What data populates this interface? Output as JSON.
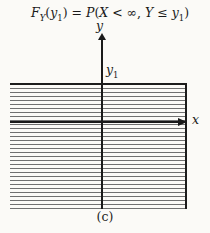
{
  "figure": {
    "title": {
      "parts": [
        {
          "text": "F"
        },
        {
          "text": "Y"
        },
        {
          "text": "("
        },
        {
          "text": "y"
        },
        {
          "text": "1"
        },
        {
          "text": ") = "
        },
        {
          "text": "P"
        },
        {
          "text": "("
        },
        {
          "text": "X"
        },
        {
          "text": " < ∞, "
        },
        {
          "text": "Y"
        },
        {
          "text": " ≤ "
        },
        {
          "text": "y"
        },
        {
          "text": "1"
        },
        {
          "text": ")"
        }
      ]
    },
    "axes": {
      "y_label": "y",
      "x_label": "x",
      "y1_label": {
        "base": "y",
        "sub": "1"
      }
    },
    "caption": "(c)",
    "colors": {
      "background": "#fbfaf7",
      "ink": "#1a1a1a",
      "axis": "#1a1a1a",
      "region_border": "#1c1c1c",
      "hatch_line": "#707070"
    }
  }
}
